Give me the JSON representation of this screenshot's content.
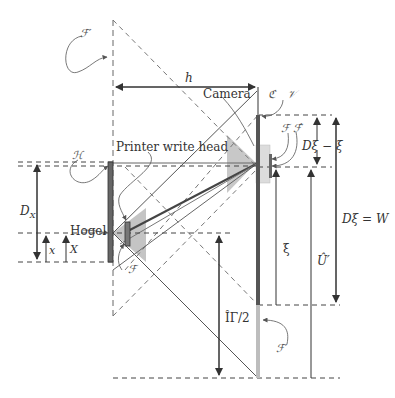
{
  "diagram": {
    "labels": {
      "script_F_top": "ℱ′",
      "h": "h",
      "camera": "Camera",
      "script_C": "ℭ",
      "script_V": "𝒱",
      "script_H": "ℋ",
      "printer_write_head": "Printer write head",
      "script_F_hat": "ℱ ℱ̂",
      "D_xi_minus_xi": "Dξ − ξ",
      "D_X": "DX",
      "D_X_main": "D",
      "D_X_sub": "X",
      "hogel": "Hogel",
      "x": "x",
      "X": "X",
      "script_F_small": "ℱ",
      "xi": "ξ",
      "D_xi_eq_W": "Dξ = W",
      "U_hat": "Û′",
      "Pi_half": "ÎΓ/2",
      "script_F_prime_bottom": "ℱ′"
    },
    "colors": {
      "line": "#555555",
      "dashed": "#666666",
      "dark_bar": "#555555",
      "grey_fill": "#b8b8b8",
      "light_fill": "#d9d9d9"
    }
  }
}
